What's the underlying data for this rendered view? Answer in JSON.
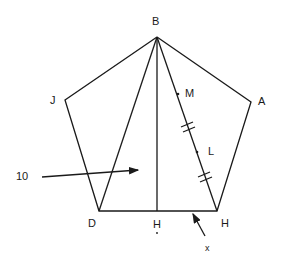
{
  "diagram": {
    "type": "geometry-figure",
    "vertices": {
      "B": "B",
      "A": "A",
      "J": "J",
      "D": "D",
      "H_vertex": "H",
      "H_foot": "H"
    },
    "labels": {
      "M": "M",
      "L": "L",
      "region_label": "10",
      "pointer_x": "x"
    },
    "marks": {
      "congruence_ticks": "double tick marks on segment BH (two locations)",
      "H_foot_dot": "•"
    },
    "colors": {
      "stroke": "#1a1a1a",
      "background": "#ffffff"
    }
  }
}
